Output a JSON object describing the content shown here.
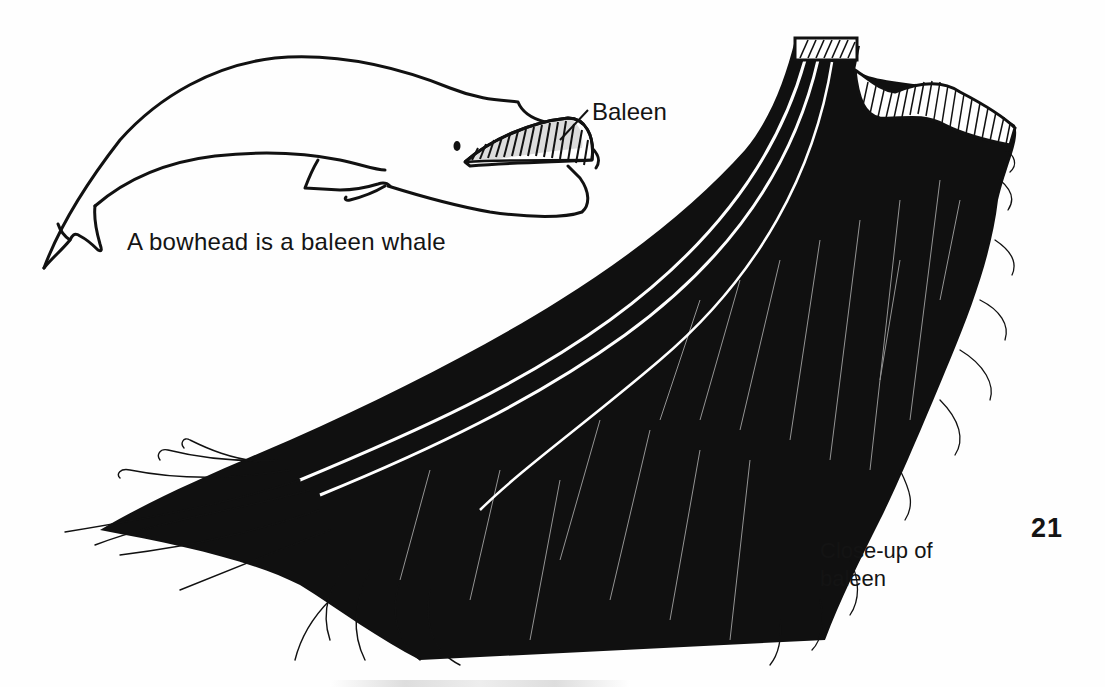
{
  "page": {
    "page_number": "21",
    "background": "#fefefe",
    "ink": "#111111"
  },
  "whale_figure": {
    "subject": "bowhead whale outline",
    "pointer_label": "Baleen",
    "caption": "A bowhead is a baleen whale"
  },
  "baleen_figure": {
    "subject": "close-up of baleen plate with bristle fringe",
    "caption_line1": "Close-up of",
    "caption_line2": "baleen"
  }
}
